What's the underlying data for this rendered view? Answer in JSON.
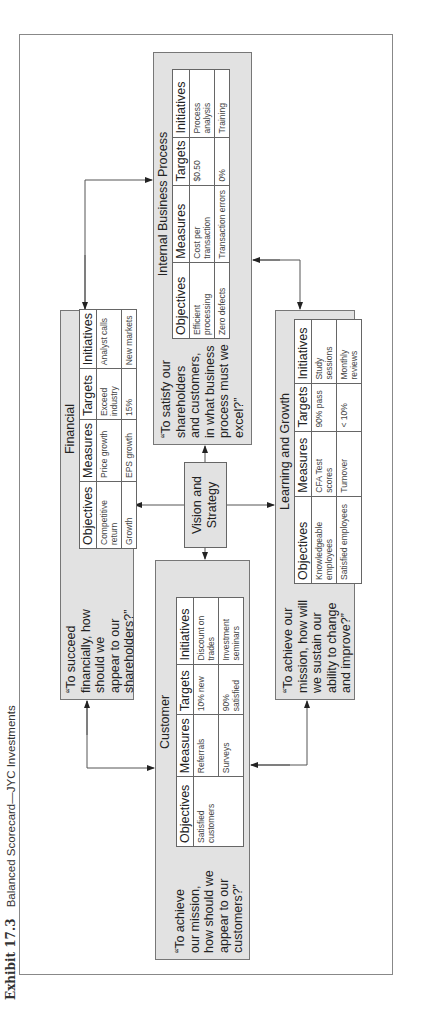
{
  "caption": {
    "label": "Exhibit 17.3",
    "title": "Balanced Scorecard—JYC Investments"
  },
  "center": {
    "label_line1": "Vision and",
    "label_line2": "Strategy"
  },
  "table_headers": [
    "Objectives",
    "Measures",
    "Targets",
    "Initiatives"
  ],
  "panels": {
    "financial": {
      "title": "Financial",
      "question": [
        "“To succeed",
        "financially, how",
        "should we",
        "appear to our",
        "shareholders?”"
      ],
      "rows": [
        {
          "objective": "Competitive return",
          "measure": "Price growth",
          "target": "Exceed industry",
          "initiative": "Analyst calls"
        },
        {
          "objective": "Growth",
          "measure": "EPS growth",
          "target": "15%",
          "initiative": "New markets"
        }
      ]
    },
    "customer": {
      "title": "Customer",
      "question": [
        "“To achieve",
        "our mission,",
        "how should we",
        "appear to our",
        "customers?”"
      ],
      "rows": [
        {
          "objective": "Satisfied customers",
          "measure": "Referrals",
          "target": "10% new",
          "initiative": "Discount on trades"
        },
        {
          "objective": "",
          "measure": "Surveys",
          "target": "90% satisfied",
          "initiative": "Investment seminars"
        }
      ]
    },
    "internal": {
      "title": "Internal Business Process",
      "question": [
        "“To satisfy our",
        "shareholders",
        "and customers,",
        "in what business",
        "process must we",
        "excel?”"
      ],
      "rows": [
        {
          "objective": "Efficient processing",
          "measure": "Cost per transaction",
          "target": "$0.50",
          "initiative": "Process analysis"
        },
        {
          "objective": "Zero defects",
          "measure": "Transaction errors",
          "target": "0%",
          "initiative": "Training"
        }
      ]
    },
    "learning": {
      "title": "Learning and Growth",
      "question": [
        "“To achieve our",
        "mission, how will",
        "we sustain our",
        "ability to change",
        "and improve?”"
      ],
      "rows": [
        {
          "objective": "Knowledgeable employees",
          "measure": "CFA Test scores",
          "target": "90% pass",
          "initiative": "Study sessions"
        },
        {
          "objective": "Satisfied employees",
          "measure": "Turnover",
          "target": "< 10%",
          "initiative": "Monthly reviews"
        }
      ]
    }
  }
}
